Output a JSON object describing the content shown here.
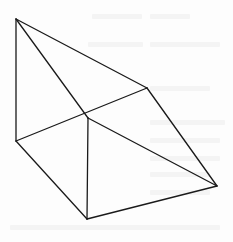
{
  "figure": {
    "type": "geometric-solid-line-drawing",
    "stroke_color": "#1a1a1a",
    "background_color": "#fdfdfd",
    "vertices": {
      "A": [
        16,
        19
      ],
      "B": [
        147,
        88
      ],
      "C": [
        16,
        141
      ],
      "D": [
        88,
        118
      ],
      "E": [
        87,
        219
      ],
      "F": [
        217,
        186
      ]
    },
    "edges": [
      [
        "A",
        "C"
      ],
      [
        "A",
        "B"
      ],
      [
        "A",
        "D"
      ],
      [
        "C",
        "B"
      ],
      [
        "B",
        "F"
      ],
      [
        "C",
        "E"
      ],
      [
        "D",
        "E"
      ],
      [
        "D",
        "F"
      ],
      [
        "E",
        "F"
      ]
    ]
  },
  "background_bleed": {
    "description": "faint illegible show-through text from reverse side of scanned page",
    "bars": [
      [
        92,
        14,
        50
      ],
      [
        150,
        14,
        40
      ],
      [
        88,
        42,
        55
      ],
      [
        150,
        42,
        70
      ],
      [
        150,
        86,
        60
      ],
      [
        150,
        120,
        75
      ],
      [
        150,
        138,
        70
      ],
      [
        150,
        156,
        70
      ],
      [
        150,
        172,
        60
      ],
      [
        150,
        190,
        60
      ],
      [
        10,
        225,
        210
      ]
    ]
  }
}
